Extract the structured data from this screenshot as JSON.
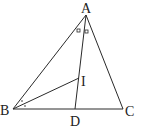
{
  "diagram": {
    "title": "",
    "points": {
      "A": {
        "label": "A",
        "x": 86,
        "y": 15
      },
      "B": {
        "label": "B",
        "x": 13,
        "y": 109
      },
      "C": {
        "label": "C",
        "x": 123,
        "y": 109
      },
      "D": {
        "label": "D",
        "x": 75,
        "y": 109
      },
      "I": {
        "label": "I",
        "x": 79,
        "y": 78
      }
    },
    "segments": [
      "AB",
      "AC",
      "BC",
      "AD",
      "BI"
    ],
    "angle_marks": {
      "at_A": "equal angles BAD and DAC marked with small squares",
      "at_B": "equal angles ABI and IBD marked with dots"
    }
  }
}
